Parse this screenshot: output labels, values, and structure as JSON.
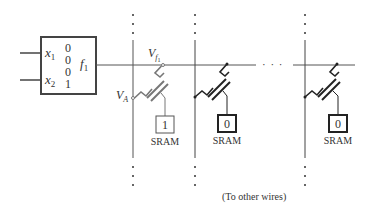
{
  "lut": {
    "inputs": [
      {
        "name": "x",
        "sub": "1"
      },
      {
        "name": "x",
        "sub": "2"
      }
    ],
    "values": [
      "0",
      "0",
      "0",
      "1"
    ],
    "output": {
      "name": "f",
      "sub": "1"
    }
  },
  "labels": {
    "wire_voltage": {
      "name": "V",
      "sub": "f",
      "subsub": "1"
    },
    "switch_voltage": {
      "name": "V",
      "sub": "A"
    },
    "ellipsis": "· · ·",
    "footnote": "(To other wires)"
  },
  "cells": [
    {
      "sram_value": "1",
      "sram_label": "SRAM"
    },
    {
      "sram_value": "0",
      "sram_label": "SRAM"
    },
    {
      "sram_value": "0",
      "sram_label": "SRAM"
    }
  ],
  "colors": {
    "line": "#333333",
    "wire": "#555555",
    "box_bold": "#333333"
  }
}
